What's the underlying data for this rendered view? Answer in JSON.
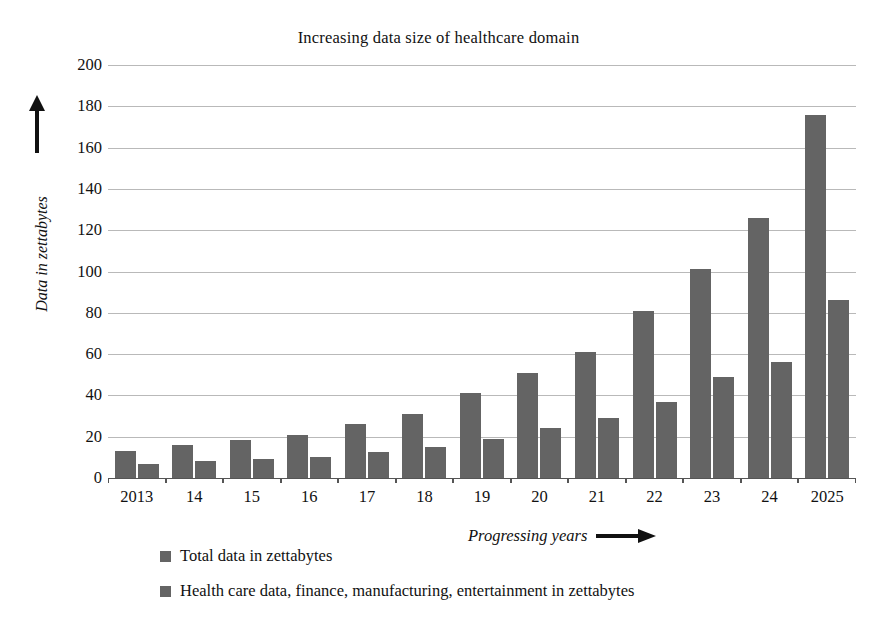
{
  "chart_data": {
    "type": "bar",
    "title": "Increasing data size of healthcare domain",
    "xlabel": "Progressing years",
    "ylabel": "Data in zettabytes",
    "categories": [
      "2013",
      "14",
      "15",
      "16",
      "17",
      "18",
      "19",
      "20",
      "21",
      "22",
      "23",
      "24",
      "2025"
    ],
    "series": [
      {
        "name": "Total data in zettabytes",
        "color": "#646464",
        "values": [
          13,
          16,
          18.5,
          21,
          26,
          31,
          41,
          51,
          61,
          81,
          101,
          126,
          176
        ]
      },
      {
        "name": "Health care data, finance, manufacturing, entertainment in zettabytes",
        "color": "#646464",
        "values": [
          7,
          8,
          9,
          10,
          12.5,
          15,
          19,
          24,
          29,
          37,
          49,
          56,
          86
        ]
      }
    ],
    "ylim": [
      0,
      200
    ],
    "ytick_step": 20,
    "yticks": [
      200,
      180,
      160,
      140,
      120,
      100,
      80,
      60,
      40,
      20,
      0
    ],
    "grid": true,
    "legend_position": "bottom-left",
    "bar_color": "#646464",
    "gridline_color": "#b9b9b9",
    "axis_color": "#555555",
    "background": "#ffffff"
  },
  "axis_arrows": {
    "y_arrow": "up-arrow-icon",
    "x_arrow": "right-arrow-icon"
  }
}
